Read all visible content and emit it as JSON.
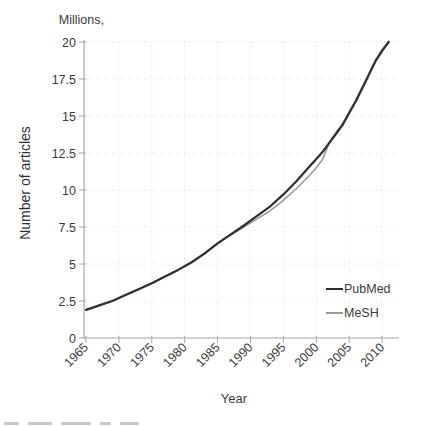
{
  "chart_data": {
    "type": "line",
    "title": "",
    "unit_label": "Millions,",
    "xlabel": "Year",
    "ylabel": "Number of articles",
    "xlim": [
      1965,
      2011
    ],
    "ylim": [
      0,
      20
    ],
    "xticks": [
      1965,
      1970,
      1975,
      1980,
      1985,
      1990,
      1995,
      2000,
      2005,
      2010
    ],
    "yticks": [
      0,
      2.5,
      5,
      7.5,
      10,
      12.5,
      15,
      17.5,
      20
    ],
    "grid": "dotted",
    "legend_position": "inside-bottom-right",
    "x": [
      1965,
      1967,
      1969,
      1971,
      1973,
      1975,
      1977,
      1979,
      1981,
      1983,
      1985,
      1987,
      1989,
      1991,
      1993,
      1995,
      1997,
      1999,
      2000,
      2001,
      2002,
      2003,
      2004,
      2005,
      2006,
      2007,
      2008,
      2009,
      2010,
      2011
    ],
    "series": [
      {
        "name": "PubMed",
        "color": "#2e2e2e",
        "width": 2.2,
        "values": [
          1.9,
          2.2,
          2.5,
          2.9,
          3.3,
          3.7,
          4.15,
          4.6,
          5.1,
          5.7,
          6.4,
          7.0,
          7.6,
          8.25,
          8.9,
          9.7,
          10.6,
          11.6,
          12.1,
          12.6,
          13.2,
          13.8,
          14.4,
          15.2,
          16.0,
          16.9,
          17.8,
          18.7,
          19.4,
          20.0
        ]
      },
      {
        "name": "MeSH",
        "color": "#9b9b9b",
        "width": 1.6,
        "values": [
          1.9,
          2.2,
          2.5,
          2.9,
          3.3,
          3.7,
          4.15,
          4.6,
          5.1,
          5.7,
          6.4,
          6.95,
          7.5,
          8.05,
          8.6,
          9.3,
          10.1,
          11.0,
          11.5,
          12.1,
          13.25,
          13.9,
          14.48,
          15.28,
          16.07,
          16.97,
          17.87,
          18.77,
          19.47,
          20.05
        ]
      }
    ],
    "style": {
      "axis_color": "#a9a9a9",
      "grid_color": "#dedede",
      "tick_text_color": "#3a3a3a",
      "background": "#ffffff"
    }
  }
}
